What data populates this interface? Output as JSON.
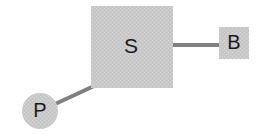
{
  "diagram": {
    "background_color": "#ffffff",
    "node_fill_color": "#c9c9c9",
    "node_texture_color": "#d6d6d6",
    "edge_color": "#808080",
    "label_color": "#1a1a1a",
    "nodes": [
      {
        "id": "S",
        "label": "S",
        "shape": "square",
        "x": 91,
        "y": 6,
        "width": 82,
        "height": 82,
        "label_x": 131,
        "label_y": 47
      },
      {
        "id": "B",
        "label": "B",
        "shape": "square",
        "x": 219,
        "y": 27,
        "width": 30,
        "height": 32,
        "label_x": 234,
        "label_y": 44
      },
      {
        "id": "P",
        "label": "P",
        "shape": "circle",
        "cx": 40,
        "cy": 111,
        "r": 18,
        "label_x": 40,
        "label_y": 112
      }
    ],
    "edges": [
      {
        "id": "s-to-b",
        "from": "S",
        "to": "B",
        "orientation": "horizontal",
        "x1": 171,
        "y1": 45,
        "x2": 221,
        "y2": 45,
        "stroke_width": 4
      },
      {
        "id": "p-to-s",
        "from": "P",
        "to": "S",
        "orientation": "diagonal",
        "x1": 53,
        "y1": 105,
        "x2": 94,
        "y2": 86,
        "stroke_width": 4
      }
    ]
  }
}
